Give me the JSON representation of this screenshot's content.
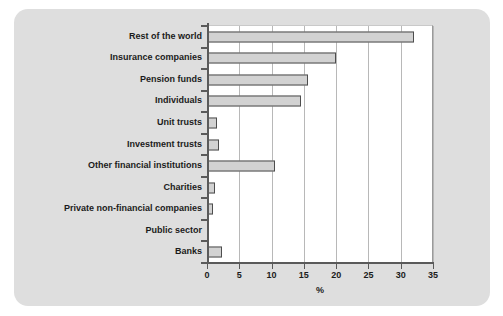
{
  "chart_data": {
    "type": "bar",
    "orientation": "horizontal",
    "title": "",
    "xlabel": "%",
    "ylabel": "",
    "xlim": [
      0,
      35
    ],
    "xticks": [
      0,
      5,
      10,
      15,
      20,
      25,
      30,
      35
    ],
    "xtick_labels": [
      "0",
      "5",
      "10",
      "15",
      "20",
      "25",
      "30",
      "35"
    ],
    "grid": "vertical",
    "legend": "none",
    "categories": [
      "Rest of the world",
      "Insurance companies",
      "Pension funds",
      "Individuals",
      "Unit trusts",
      "Investment trusts",
      "Other financial institutions",
      "Charities",
      "Private non-financial companies",
      "Public sector",
      "Banks"
    ],
    "values": [
      32.0,
      20.0,
      15.6,
      14.5,
      1.6,
      1.8,
      10.5,
      1.2,
      0.9,
      0.2,
      2.3
    ],
    "bar_fill_color": "#d2d2d2",
    "bar_edge_color": "#4d4d4d",
    "plot_background": "#ffffff",
    "panel_background": "#dedede",
    "gridline_color": "#b8b8b8",
    "axis_color": "#5a5a5a"
  }
}
